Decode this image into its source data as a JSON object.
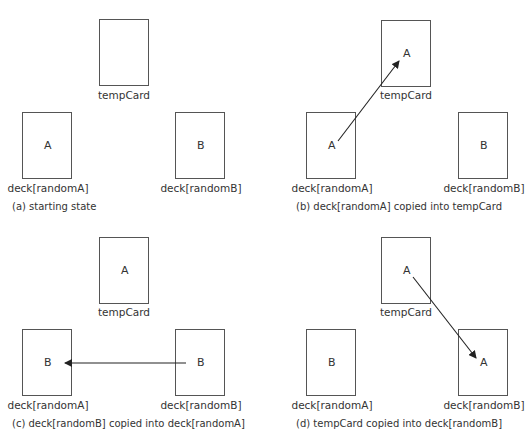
{
  "labels": {
    "temp": "tempCard",
    "deckA": "deck[randomA]",
    "deckB": "deck[randomB]"
  },
  "panels": [
    {
      "caption": "(a) starting state",
      "temp_value": "",
      "deckA_value": "A",
      "deckB_value": "B"
    },
    {
      "caption": "(b) deck[randomA] copied into tempCard",
      "temp_value": "A",
      "deckA_value": "A",
      "deckB_value": "B",
      "arrow": "deck[randomA] -> tempCard"
    },
    {
      "caption": "(c) deck[randomB] copied into deck[randomA]",
      "temp_value": "A",
      "deckA_value": "B",
      "deckB_value": "B",
      "arrow": "deck[randomB] -> deck[randomA]"
    },
    {
      "caption": "(d) tempCard copied into deck[randomB]",
      "temp_value": "A",
      "deckA_value": "B",
      "deckB_value": "A",
      "arrow": "tempCard -> deck[randomB]"
    }
  ],
  "colors": {
    "stroke": "#555555",
    "text": "#333333",
    "arrow": "#222222"
  }
}
